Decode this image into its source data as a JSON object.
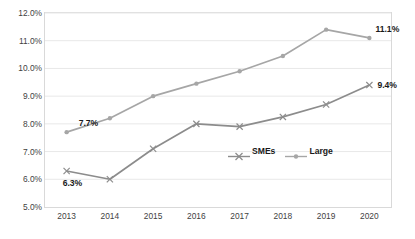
{
  "chart_data": {
    "type": "line",
    "title": "",
    "subtitle": "",
    "xlabel": "",
    "ylabel": "",
    "categories": [
      "2013",
      "2014",
      "2015",
      "2016",
      "2017",
      "2018",
      "2019",
      "2020"
    ],
    "ylim": [
      5.0,
      12.0
    ],
    "ytick_labels": [
      "12.0%",
      "11.0%",
      "10.0%",
      "9.0%",
      "8.0%",
      "7.0%",
      "6.0%",
      "5.0%"
    ],
    "ytick_values": [
      12.0,
      11.0,
      10.0,
      9.0,
      8.0,
      7.0,
      6.0,
      5.0
    ],
    "grid": true,
    "legend_position": "inside-center-right",
    "series": [
      {
        "name": "SMEs",
        "marker": "x",
        "color": "#8c8c8c",
        "values": [
          6.3,
          6.0,
          7.1,
          8.0,
          7.9,
          8.25,
          8.7,
          9.4
        ]
      },
      {
        "name": "Large",
        "marker": "circle",
        "color": "#a6a6a6",
        "values": [
          7.7,
          8.2,
          9.0,
          9.45,
          9.9,
          10.45,
          11.4,
          11.1
        ]
      }
    ],
    "annotations": [
      {
        "text": "7.7%",
        "series": "Large",
        "category": "2013"
      },
      {
        "text": "6.3%",
        "series": "SMEs",
        "category": "2013"
      },
      {
        "text": "11.1%",
        "series": "Large",
        "category": "2020"
      },
      {
        "text": "9.4%",
        "series": "SMEs",
        "category": "2020"
      }
    ]
  },
  "legend": {
    "items": [
      {
        "label": "SMEs"
      },
      {
        "label": "Large"
      }
    ]
  },
  "colors": {
    "series_smes": "#8c8c8c",
    "series_large": "#a6a6a6",
    "grid": "#e8e8e8",
    "frame": "#d9d9d9",
    "text": "#3f3f3f",
    "label_text": "#1a1a1a"
  }
}
